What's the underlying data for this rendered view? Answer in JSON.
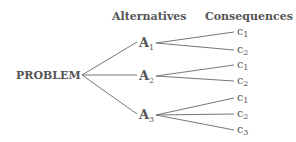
{
  "headers": {
    "alternatives": "Alternatives",
    "consequences": "Consequences"
  },
  "root": {
    "label": "PROBLEM"
  },
  "alternatives": [
    {
      "label": "A",
      "sub": "1",
      "consequences": [
        {
          "label": "c",
          "sub": "1"
        },
        {
          "label": "c",
          "sub": "2"
        }
      ]
    },
    {
      "label": "A",
      "sub": "2",
      "consequences": [
        {
          "label": "c",
          "sub": "1"
        },
        {
          "label": "c",
          "sub": "2"
        }
      ]
    },
    {
      "label": "A",
      "sub": "3",
      "consequences": [
        {
          "label": "c",
          "sub": "1"
        },
        {
          "label": "c",
          "sub": "2"
        },
        {
          "label": "c",
          "sub": "3"
        }
      ]
    }
  ],
  "colors": {
    "text": "#555555",
    "line": "#777777",
    "background": "#ffffff"
  }
}
